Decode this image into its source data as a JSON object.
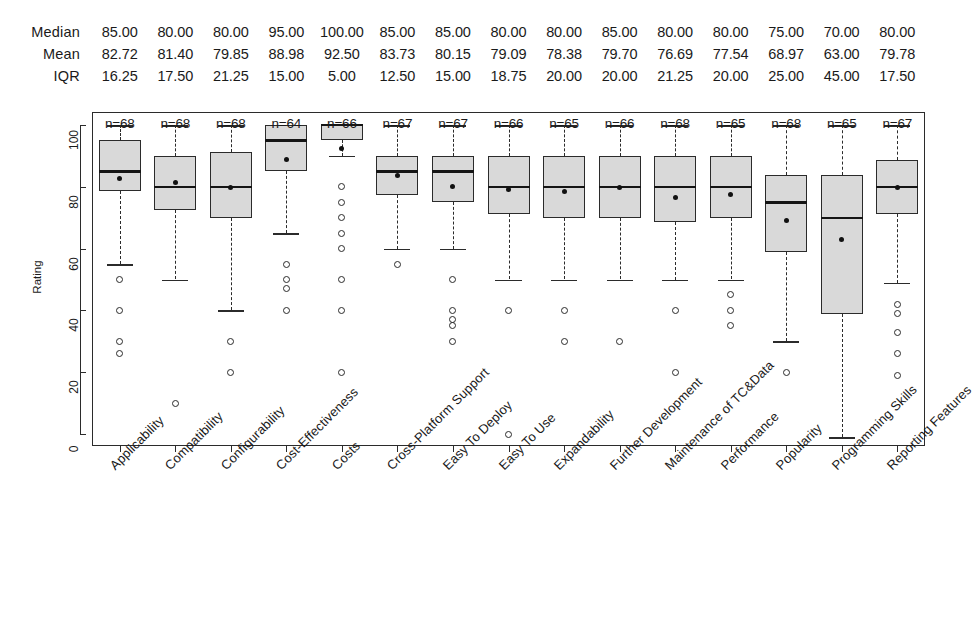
{
  "chart_data": {
    "type": "box",
    "title": "",
    "xlabel": "",
    "ylabel": "Rating",
    "ylim": [
      0,
      100
    ],
    "yticks": [
      0,
      20,
      40,
      60,
      80,
      100
    ],
    "grid": false,
    "legend": "none",
    "stat_row_labels": [
      "Median",
      "Mean",
      "IQR"
    ],
    "count_prefix": "n=",
    "categories": [
      "Applicability",
      "Compatibility",
      "Configurability",
      "Cost-Effectiveness",
      "Costs",
      "Cross-Platform Support",
      "Easy To Deploy",
      "Easy To Use",
      "Expandability",
      "Further Development",
      "Maintenance of TC&Data",
      "Performance",
      "Popularity",
      "Programming Skills",
      "Reporting Features"
    ],
    "median": [
      "85.00",
      "80.00",
      "80.00",
      "95.00",
      "100.00",
      "85.00",
      "85.00",
      "80.00",
      "80.00",
      "85.00",
      "80.00",
      "80.00",
      "75.00",
      "70.00",
      "80.00"
    ],
    "mean": [
      "82.72",
      "81.40",
      "79.85",
      "88.98",
      "92.50",
      "83.73",
      "80.15",
      "79.09",
      "78.38",
      "79.70",
      "76.69",
      "77.54",
      "68.97",
      "63.00",
      "79.78"
    ],
    "iqr": [
      "16.25",
      "17.50",
      "21.25",
      "15.00",
      "5.00",
      "12.50",
      "15.00",
      "18.75",
      "20.00",
      "20.00",
      "21.25",
      "20.00",
      "25.00",
      "45.00",
      "17.50"
    ],
    "n": [
      "n=68",
      "n=68",
      "n=68",
      "n=64",
      "n=66",
      "n=67",
      "n=67",
      "n=66",
      "n=65",
      "n=66",
      "n=68",
      "n=65",
      "n=68",
      "n=65",
      "n=67"
    ],
    "boxes": [
      {
        "name": "Applicability",
        "q1": 78.75,
        "median": 85,
        "q3": 95,
        "mean": 82.72,
        "lower": 55,
        "upper": 100,
        "outliers": [
          50,
          40,
          30,
          26
        ]
      },
      {
        "name": "Compatibility",
        "q1": 72.5,
        "median": 80,
        "q3": 90,
        "mean": 81.4,
        "lower": 50,
        "upper": 100,
        "outliers": [
          10
        ]
      },
      {
        "name": "Configurability",
        "q1": 70,
        "median": 80,
        "q3": 91.25,
        "mean": 79.85,
        "lower": 40,
        "upper": 100,
        "outliers": [
          30,
          20
        ]
      },
      {
        "name": "Cost-Effectiveness",
        "q1": 85,
        "median": 95,
        "q3": 100,
        "mean": 88.98,
        "lower": 65,
        "upper": 100,
        "outliers": [
          55,
          50,
          47,
          40
        ]
      },
      {
        "name": "Costs",
        "q1": 95,
        "median": 100,
        "q3": 100,
        "mean": 92.5,
        "lower": 90,
        "upper": 100,
        "outliers": [
          80,
          75,
          70,
          65,
          60,
          50,
          40,
          20
        ]
      },
      {
        "name": "Cross-Platform Support",
        "q1": 77.5,
        "median": 85,
        "q3": 90,
        "mean": 83.73,
        "lower": 60,
        "upper": 100,
        "outliers": [
          55
        ]
      },
      {
        "name": "Easy To Deploy",
        "q1": 75,
        "median": 85,
        "q3": 90,
        "mean": 80.15,
        "lower": 60,
        "upper": 100,
        "outliers": [
          50,
          40,
          37,
          35,
          30
        ]
      },
      {
        "name": "Easy To Use",
        "q1": 71.25,
        "median": 80,
        "q3": 90,
        "mean": 79.09,
        "lower": 50,
        "upper": 100,
        "outliers": [
          40,
          0
        ]
      },
      {
        "name": "Expandability",
        "q1": 70,
        "median": 80,
        "q3": 90,
        "mean": 78.38,
        "lower": 50,
        "upper": 100,
        "outliers": [
          40,
          30
        ]
      },
      {
        "name": "Further Development",
        "q1": 70,
        "median": 80,
        "q3": 90,
        "mean": 79.7,
        "lower": 50,
        "upper": 100,
        "outliers": [
          30
        ]
      },
      {
        "name": "Maintenance of TC&Data",
        "q1": 68.75,
        "median": 80,
        "q3": 90,
        "mean": 76.69,
        "lower": 50,
        "upper": 100,
        "outliers": [
          40,
          20
        ]
      },
      {
        "name": "Performance",
        "q1": 70,
        "median": 80,
        "q3": 90,
        "mean": 77.54,
        "lower": 50,
        "upper": 100,
        "outliers": [
          45,
          40,
          35
        ]
      },
      {
        "name": "Popularity",
        "q1": 58.75,
        "median": 75,
        "q3": 83.75,
        "mean": 68.97,
        "lower": 30,
        "upper": 100,
        "outliers": [
          20
        ]
      },
      {
        "name": "Programming Skills",
        "q1": 38.75,
        "median": 70,
        "q3": 83.75,
        "mean": 63.0,
        "lower": -1,
        "upper": 100,
        "outliers": []
      },
      {
        "name": "Reporting Features",
        "q1": 71.25,
        "median": 80,
        "q3": 88.75,
        "mean": 79.78,
        "lower": 49,
        "upper": 100,
        "outliers": [
          42,
          39,
          33,
          26,
          19
        ]
      }
    ]
  }
}
